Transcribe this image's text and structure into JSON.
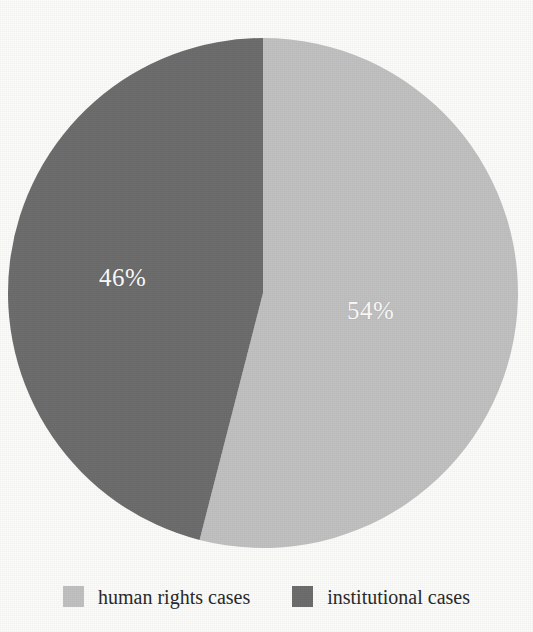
{
  "chart_data": {
    "type": "pie",
    "title": "",
    "subtitle": "",
    "xlabel": "",
    "ylabel": "",
    "grid": false,
    "legend_position": "bottom",
    "start_angle_deg": 0,
    "direction": "clockwise",
    "total_percent": 100,
    "categories": [
      "human rights cases",
      "institutional cases"
    ],
    "values": [
      54,
      46
    ],
    "data_labels": [
      "54%",
      "46%"
    ],
    "colors": [
      "#c2c2c2",
      "#6e6e6e"
    ],
    "slices": [
      {
        "label": "human rights cases",
        "value": 54,
        "data_label": "54%",
        "color": "#c2c2c2",
        "label_color": "#ffffff"
      },
      {
        "label": "institutional cases",
        "value": 46,
        "data_label": "46%",
        "color": "#6e6e6e",
        "label_color": "#ffffff"
      }
    ]
  },
  "pie": {
    "center_x": 263,
    "center_y": 293,
    "radius": 255,
    "label_light": "54%",
    "label_dark": "46%"
  },
  "legend": {
    "entries": [
      {
        "label": "human rights cases",
        "color": "#c2c2c2"
      },
      {
        "label": "institutional cases",
        "color": "#6e6e6e"
      }
    ]
  },
  "colors": {
    "background": "#fdfdfc",
    "light_slice": "#c2c2c2",
    "dark_slice": "#6e6e6e",
    "label_text": "#ffffff",
    "legend_text": "#2a2a2a"
  }
}
